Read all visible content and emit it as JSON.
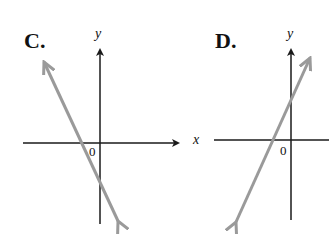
{
  "panels": [
    {
      "label": "C.",
      "y_axis_label": "y",
      "x_axis_label": "x",
      "origin_label": "0",
      "line": {
        "slope_sign": "negative",
        "description": "steep decreasing line crossing x-axis left of origin and y-axis below origin"
      }
    },
    {
      "label": "D.",
      "y_axis_label": "y",
      "origin_label": "0",
      "line": {
        "slope_sign": "positive",
        "description": "steep increasing line crossing x-axis left of origin and y-axis above origin"
      }
    }
  ],
  "colors": {
    "axis": "#1a1a1a",
    "line": "#9a9a9a"
  }
}
